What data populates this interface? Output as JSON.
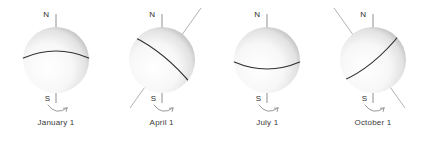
{
  "figure": {
    "background_color": "#ffffff",
    "line_color": "#3c3c3c",
    "axis_color": "#9a9a9a",
    "equator_color": "#2f2f2f",
    "label_color": "#2b2b2b",
    "caption_color": "#3a3a3a",
    "sphere_light_color": "#ffffff",
    "sphere_shadow_color": "#b9b9b9"
  },
  "labels": {
    "north_pole": "N",
    "south_pole": "S"
  },
  "globes": [
    {
      "id": "january",
      "caption": "January 1",
      "axis_tilt_deg": 0,
      "equator_curve": "convex-up",
      "axis_visible_through_sphere": false,
      "rotation_arrow": "counterclockwise-from-south"
    },
    {
      "id": "april",
      "caption": "April 1",
      "axis_tilt_deg": 30,
      "equator_curve": "tilted-down-right",
      "axis_visible_through_sphere": true,
      "rotation_arrow": "counterclockwise-from-south"
    },
    {
      "id": "july",
      "caption": "July 1",
      "axis_tilt_deg": 0,
      "equator_curve": "convex-down",
      "axis_visible_through_sphere": false,
      "rotation_arrow": "counterclockwise-from-south"
    },
    {
      "id": "october",
      "caption": "October 1",
      "axis_tilt_deg": -30,
      "equator_curve": "tilted-up-right",
      "axis_visible_through_sphere": true,
      "rotation_arrow": "counterclockwise-from-south"
    }
  ]
}
